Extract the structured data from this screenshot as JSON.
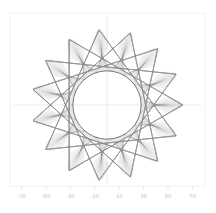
{
  "figure": {
    "title": "",
    "background_color": "#ffffff",
    "frame_color": "#ededed",
    "axis_color": "#d8d8d8",
    "tick_label_color": "#bdbdbd",
    "line_color": "#8c8c8c",
    "envelope_color": "#5d5d5d",
    "width_px": 216,
    "height_px": 213
  },
  "plot_area": {
    "left_px": 10,
    "top_px": 13,
    "right_px": 205,
    "bottom_px": 186,
    "origin_x_px": 107,
    "origin_y_px": 105,
    "px_per_unit": 1.22
  },
  "chart_data": {
    "type": "line",
    "title": "",
    "xlabel": "",
    "ylabel": "",
    "grid": false,
    "legend": null,
    "xlim": [
      -80,
      80
    ],
    "ylim": [
      -78,
      72
    ],
    "xticks": [
      -70,
      -50,
      -30,
      -10,
      10,
      30,
      50,
      70
    ],
    "xtick_labels": [
      "-70",
      "-50",
      "-30",
      "-10",
      "10",
      "30",
      "50",
      "70"
    ],
    "yticks": [],
    "ytick_labels": [],
    "series": [
      {
        "name": "chord-family",
        "kind": "segments",
        "n_segments": 300,
        "color": "#8c8c8c",
        "opacity": 0.3,
        "linewidth": 0.35,
        "params": {
          "R_outer": 62,
          "r_inner": 28,
          "petals": 15,
          "turns": 20,
          "step_ratio": 0.0667
        }
      },
      {
        "name": "inner-envelope-circle",
        "kind": "circle",
        "center": [
          0,
          0
        ],
        "radius": 28,
        "color": "#5d5d5d",
        "linewidth": 0.85
      }
    ],
    "x": [],
    "values": []
  }
}
